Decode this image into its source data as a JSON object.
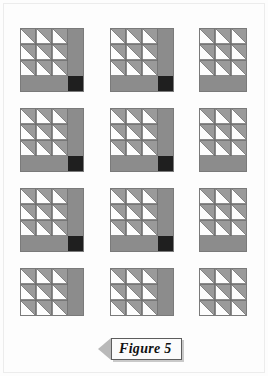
{
  "page": {
    "background_color": "#fdfdfd",
    "kind": "scanned-book-page"
  },
  "caption": {
    "label": "Figure 5",
    "arrow_direction": "left",
    "arrow_color": "#b9b9b9",
    "box_border_color": "#5d5d5d",
    "box_fill_color": "#fbfbfb"
  },
  "palette": {
    "triangle_gray": "#9a9a9a",
    "triangle_white": "#fdfdfd",
    "strip_gray": "#8c8c8c",
    "corner_dark": "#1f1f1f",
    "cell_outline": "#6f6f6f",
    "block_outline": "#7a7a7a"
  },
  "figures": {
    "rows": 4,
    "columns": 3,
    "cell_size": 16,
    "triangle_grid": 3,
    "layout": [
      {
        "row": 1,
        "column": 1,
        "name": "block-r1c1",
        "x": 20,
        "y": 4,
        "has_right_strip": true,
        "has_bottom_strip": true,
        "has_dark_corner": true,
        "corner_position": "bottom-right"
      },
      {
        "row": 1,
        "column": 2,
        "name": "block-r1c2",
        "x": 110,
        "y": 4,
        "has_right_strip": true,
        "has_bottom_strip": true,
        "has_dark_corner": true,
        "corner_position": "bottom-right"
      },
      {
        "row": 1,
        "column": 3,
        "name": "block-r1c3",
        "x": 199,
        "y": 4,
        "has_right_strip": false,
        "has_bottom_strip": true,
        "has_dark_corner": false,
        "corner_position": "none"
      },
      {
        "row": 2,
        "column": 1,
        "name": "block-r2c1",
        "x": 20,
        "y": 84,
        "has_right_strip": true,
        "has_bottom_strip": true,
        "has_dark_corner": true,
        "corner_position": "bottom-right"
      },
      {
        "row": 2,
        "column": 2,
        "name": "block-r2c2",
        "x": 110,
        "y": 84,
        "has_right_strip": true,
        "has_bottom_strip": true,
        "has_dark_corner": true,
        "corner_position": "bottom-right"
      },
      {
        "row": 2,
        "column": 3,
        "name": "block-r2c3",
        "x": 199,
        "y": 84,
        "has_right_strip": false,
        "has_bottom_strip": true,
        "has_dark_corner": false,
        "corner_position": "none"
      },
      {
        "row": 3,
        "column": 1,
        "name": "block-r3c1",
        "x": 20,
        "y": 164,
        "has_right_strip": true,
        "has_bottom_strip": true,
        "has_dark_corner": true,
        "corner_position": "bottom-right"
      },
      {
        "row": 3,
        "column": 2,
        "name": "block-r3c2",
        "x": 110,
        "y": 164,
        "has_right_strip": true,
        "has_bottom_strip": true,
        "has_dark_corner": true,
        "corner_position": "bottom-right"
      },
      {
        "row": 3,
        "column": 3,
        "name": "block-r3c3",
        "x": 199,
        "y": 164,
        "has_right_strip": false,
        "has_bottom_strip": true,
        "has_dark_corner": false,
        "corner_position": "none"
      },
      {
        "row": 4,
        "column": 1,
        "name": "block-r4c1",
        "x": 20,
        "y": 244,
        "has_right_strip": true,
        "has_bottom_strip": false,
        "has_dark_corner": false,
        "corner_position": "none"
      },
      {
        "row": 4,
        "column": 2,
        "name": "block-r4c2",
        "x": 110,
        "y": 244,
        "has_right_strip": true,
        "has_bottom_strip": false,
        "has_dark_corner": false,
        "corner_position": "none"
      },
      {
        "row": 4,
        "column": 3,
        "name": "block-r4c3",
        "x": 199,
        "y": 244,
        "has_right_strip": false,
        "has_bottom_strip": false,
        "has_dark_corner": false,
        "corner_position": "none"
      }
    ]
  }
}
